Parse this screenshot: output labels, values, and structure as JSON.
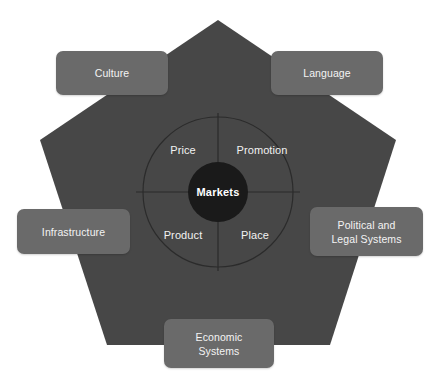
{
  "diagram": {
    "type": "pentagon-marketing-mix",
    "colors": {
      "background": "#ffffff",
      "pentagon_fill": "#474747",
      "box_fill": "#6a6a6a",
      "center_circle_fill": "#1a1a1a",
      "line_stroke": "#2b2b2b",
      "text": "#f2f2f2",
      "center_text": "#ffffff"
    },
    "center": {
      "label": "Markets"
    },
    "quadrants": [
      {
        "id": "price",
        "label": "Price",
        "position": "top-left"
      },
      {
        "id": "promotion",
        "label": "Promotion",
        "position": "top-right"
      },
      {
        "id": "product",
        "label": "Product",
        "position": "bottom-left"
      },
      {
        "id": "place",
        "label": "Place",
        "position": "bottom-right"
      }
    ],
    "factors": [
      {
        "id": "culture",
        "label": "Culture",
        "position": "top-left"
      },
      {
        "id": "language",
        "label": "Language",
        "position": "top-right"
      },
      {
        "id": "infrastructure",
        "label": "Infrastructure",
        "position": "left"
      },
      {
        "id": "political-legal-systems",
        "label": "Political and\nLegal Systems",
        "line1": "Political and",
        "line2": "Legal Systems",
        "position": "right"
      },
      {
        "id": "economic-systems",
        "label": "Economic\nSystems",
        "line1": "Economic",
        "line2": "Systems",
        "position": "bottom"
      }
    ]
  }
}
